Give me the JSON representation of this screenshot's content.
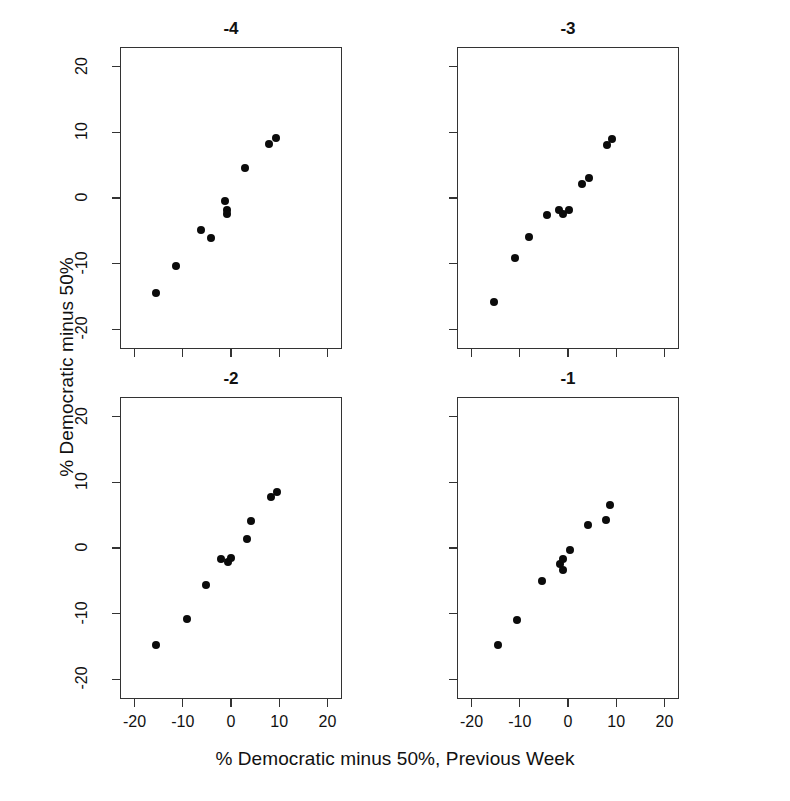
{
  "chart_data": {
    "type": "scatter",
    "title": "",
    "xlabel": "% Democratic minus 50%, Previous Week",
    "ylabel": "% Democratic minus 50%",
    "xlim": [
      -23,
      23
    ],
    "ylim": [
      -23,
      23
    ],
    "xticks": [
      -20,
      -10,
      0,
      10,
      20
    ],
    "yticks": [
      -20,
      -10,
      0,
      10,
      20
    ],
    "xtick_labels": [
      "-20",
      "-10",
      "0",
      "10",
      "20"
    ],
    "ytick_labels": [
      "-20",
      "-10",
      "0",
      "10",
      "20"
    ],
    "grid": false,
    "legend": "none",
    "layout": "2x2 panel grid",
    "panels": [
      {
        "title": "-4",
        "row": 0,
        "col": 0,
        "points": [
          {
            "x": -15.6,
            "y": -14.4
          },
          {
            "x": -11.3,
            "y": -10.3
          },
          {
            "x": -6.2,
            "y": -4.9
          },
          {
            "x": -4.2,
            "y": -6.1
          },
          {
            "x": -1.2,
            "y": -0.5
          },
          {
            "x": -0.9,
            "y": -1.9
          },
          {
            "x": -0.9,
            "y": -2.4
          },
          {
            "x": 2.9,
            "y": 4.6
          },
          {
            "x": 7.9,
            "y": 8.2
          },
          {
            "x": 9.4,
            "y": 9.2
          }
        ]
      },
      {
        "title": "-3",
        "row": 0,
        "col": 1,
        "points": [
          {
            "x": -15.3,
            "y": -15.9
          },
          {
            "x": -11.0,
            "y": -9.2
          },
          {
            "x": -8.0,
            "y": -5.9
          },
          {
            "x": -4.3,
            "y": -2.6
          },
          {
            "x": -1.8,
            "y": -1.8
          },
          {
            "x": -1.1,
            "y": -2.4
          },
          {
            "x": 0.2,
            "y": -1.9
          },
          {
            "x": 3.0,
            "y": 2.2
          },
          {
            "x": 4.4,
            "y": 3.1
          },
          {
            "x": 8.0,
            "y": 8.1
          },
          {
            "x": 9.2,
            "y": 9.0
          }
        ]
      },
      {
        "title": "-2",
        "row": 1,
        "col": 0,
        "points": [
          {
            "x": -15.6,
            "y": -14.7
          },
          {
            "x": -9.1,
            "y": -10.8
          },
          {
            "x": -5.2,
            "y": -5.6
          },
          {
            "x": -2.0,
            "y": -1.7
          },
          {
            "x": -0.7,
            "y": -2.2
          },
          {
            "x": -0.1,
            "y": -1.5
          },
          {
            "x": 3.3,
            "y": 1.4
          },
          {
            "x": 4.1,
            "y": 4.1
          },
          {
            "x": 8.3,
            "y": 7.7
          },
          {
            "x": 9.5,
            "y": 8.6
          }
        ]
      },
      {
        "title": "-1",
        "row": 1,
        "col": 1,
        "points": [
          {
            "x": -14.6,
            "y": -14.8
          },
          {
            "x": -10.5,
            "y": -11.0
          },
          {
            "x": -5.3,
            "y": -5.0
          },
          {
            "x": -1.7,
            "y": -2.5
          },
          {
            "x": -1.1,
            "y": -1.6
          },
          {
            "x": -1.0,
            "y": -3.4
          },
          {
            "x": 0.5,
            "y": -0.3
          },
          {
            "x": 4.2,
            "y": 3.5
          },
          {
            "x": 7.9,
            "y": 4.2
          },
          {
            "x": 8.7,
            "y": 6.6
          }
        ]
      }
    ]
  }
}
